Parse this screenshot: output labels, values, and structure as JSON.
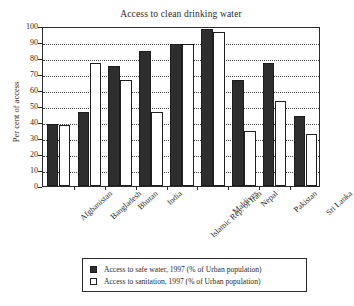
{
  "chart_data": {
    "type": "bar",
    "title": "Access to clean drinking water",
    "xlabel": "",
    "ylabel": "Per cent of access",
    "ylim": [
      0,
      100
    ],
    "ytick_step": 10,
    "yticks": [
      0,
      10,
      20,
      30,
      40,
      50,
      60,
      70,
      80,
      90,
      100
    ],
    "grid": true,
    "grid_axis": "y",
    "legend_position": "bottom",
    "categories": [
      "Afghanistan",
      "Bangladesh",
      "Bhutan",
      "India",
      "Islamic Rep. of Iran",
      "Maldives",
      "Nepal",
      "Pakistan",
      "Sri Lanka"
    ],
    "series": [
      {
        "name": "Access to safe water, 1997 (% of Urban population)",
        "color": "#2e2e2e",
        "values": [
          39,
          46.5,
          75,
          84.5,
          89,
          98,
          66,
          77,
          44
        ]
      },
      {
        "name": "Access to sanitation, 1997 (% of Urban population)",
        "color": "#ffffff",
        "values": [
          38,
          77,
          66,
          46,
          89,
          96,
          34.5,
          53,
          32.5
        ]
      }
    ]
  },
  "legend": {
    "items": [
      {
        "swatch": "filled-dark-square",
        "label": "Access to safe water, 1997 (% of Urban population)"
      },
      {
        "swatch": "outlined-white-square",
        "label": "Access to sanitation, 1997 (% of Urban population)"
      }
    ]
  }
}
